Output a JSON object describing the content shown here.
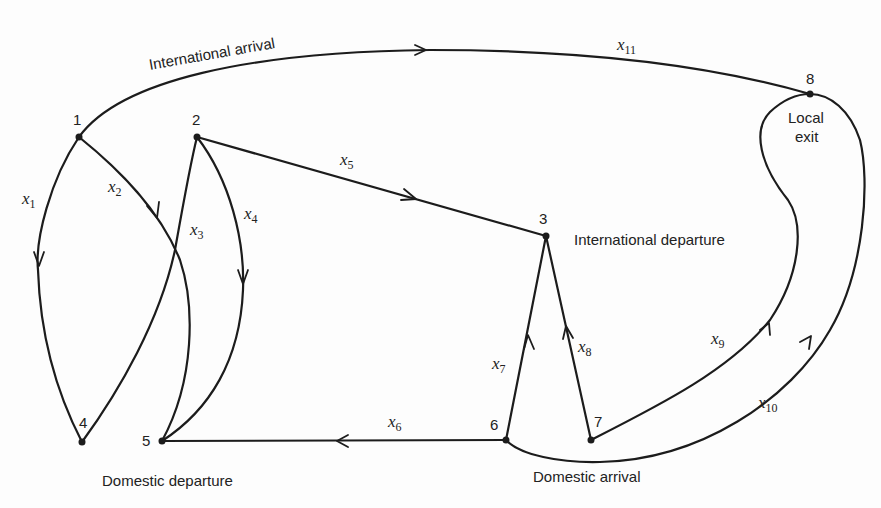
{
  "diagram": {
    "type": "directed-network",
    "nodes": [
      {
        "id": "1",
        "label": "1",
        "x": 79,
        "y": 137
      },
      {
        "id": "2",
        "label": "2",
        "x": 197,
        "y": 137
      },
      {
        "id": "3",
        "label": "3",
        "x": 546,
        "y": 236
      },
      {
        "id": "4",
        "label": "4",
        "x": 82,
        "y": 442
      },
      {
        "id": "5",
        "label": "5",
        "x": 162,
        "y": 441
      },
      {
        "id": "6",
        "label": "6",
        "x": 506,
        "y": 440
      },
      {
        "id": "7",
        "label": "7",
        "x": 591,
        "y": 440
      },
      {
        "id": "8",
        "label": "8",
        "x": 810,
        "y": 94
      }
    ],
    "edges": [
      {
        "id": "x1",
        "var": "x",
        "sub": "1",
        "from": "1",
        "to": "4"
      },
      {
        "id": "x2",
        "var": "x",
        "sub": "2",
        "from": "1",
        "to": "5"
      },
      {
        "id": "x3",
        "var": "x",
        "sub": "3",
        "from": "4",
        "to": "2"
      },
      {
        "id": "x4",
        "var": "x",
        "sub": "4",
        "from": "2",
        "to": "5"
      },
      {
        "id": "x5",
        "var": "x",
        "sub": "5",
        "from": "2",
        "to": "3"
      },
      {
        "id": "x6",
        "var": "x",
        "sub": "6",
        "from": "6",
        "to": "5"
      },
      {
        "id": "x7",
        "var": "x",
        "sub": "7",
        "from": "6",
        "to": "3"
      },
      {
        "id": "x8",
        "var": "x",
        "sub": "8",
        "from": "7",
        "to": "3"
      },
      {
        "id": "x9",
        "var": "x",
        "sub": "9",
        "from": "7",
        "to": "8"
      },
      {
        "id": "x10",
        "var": "x",
        "sub": "10",
        "from": "6",
        "to": "8"
      },
      {
        "id": "x11",
        "var": "x",
        "sub": "11",
        "from": "1",
        "to": "8"
      }
    ],
    "annotations": {
      "international_arrival": "International arrival",
      "international_departure": "International departure",
      "domestic_departure": "Domestic departure",
      "domestic_arrival": "Domestic arrival",
      "local_exit_line1": "Local",
      "local_exit_line2": "exit"
    },
    "colors": {
      "stroke": "#1c1c1c",
      "background": "#fdfdfd"
    }
  }
}
